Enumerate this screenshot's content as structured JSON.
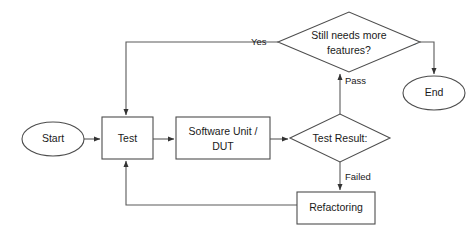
{
  "diagram": {
    "type": "flowchart",
    "background_color": "#ffffff",
    "stroke_color": "#4d4d4d",
    "edge_color": "#5a5a5a",
    "text_color": "#1a1a1a",
    "nodes": [
      {
        "id": "start",
        "label": "Start",
        "shape": "ellipse",
        "cx": 53,
        "cy": 139,
        "rx": 31,
        "ry": 17
      },
      {
        "id": "test",
        "label": "Test",
        "shape": "rectangle",
        "x": 102,
        "y": 117,
        "w": 51,
        "h": 42
      },
      {
        "id": "sut",
        "label_line1": "Software Unit /",
        "label_line2": "DUT",
        "shape": "rectangle",
        "x": 176,
        "y": 117,
        "w": 94,
        "h": 42
      },
      {
        "id": "testresult",
        "label": "Test Result:",
        "shape": "diamond",
        "cx": 340,
        "cy": 138,
        "rx": 50,
        "ry": 24
      },
      {
        "id": "refactoring",
        "label": "Refactoring",
        "shape": "rectangle",
        "x": 297,
        "y": 192,
        "w": 78,
        "h": 32
      },
      {
        "id": "needsmore",
        "label_line1": "Still needs more",
        "label_line2": "features?",
        "shape": "diamond",
        "cx": 349,
        "cy": 42,
        "rx": 71,
        "ry": 30
      },
      {
        "id": "end",
        "label": "End",
        "shape": "ellipse",
        "cx": 434,
        "cy": 93,
        "rx": 31,
        "ry": 17
      }
    ],
    "edges": [
      {
        "id": "start-to-test",
        "from": "start",
        "to": "test",
        "label": ""
      },
      {
        "id": "test-to-sut",
        "from": "test",
        "to": "sut",
        "label": ""
      },
      {
        "id": "sut-to-testresult",
        "from": "sut",
        "to": "testresult",
        "label": ""
      },
      {
        "id": "testresult-pass",
        "from": "testresult",
        "to": "needsmore",
        "label": "Pass"
      },
      {
        "id": "testresult-failed",
        "from": "testresult",
        "to": "refactoring",
        "label": "Failed"
      },
      {
        "id": "refactoring-to-test",
        "from": "refactoring",
        "to": "test",
        "label": ""
      },
      {
        "id": "needsmore-yes",
        "from": "needsmore",
        "to": "test",
        "label": "Yes"
      },
      {
        "id": "needsmore-no",
        "from": "needsmore",
        "to": "end",
        "label": "No"
      }
    ],
    "edge_labels": {
      "pass": {
        "text": "Pass",
        "x": 345,
        "y": 81
      },
      "failed": {
        "text": "Failed",
        "x": 345,
        "y": 177
      },
      "yes": {
        "text": "Yes",
        "x": 251,
        "y": 42
      },
      "no": {
        "text": "No",
        "x": 404,
        "y": 42
      }
    }
  }
}
